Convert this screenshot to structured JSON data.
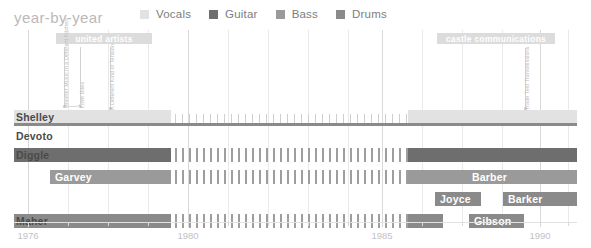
{
  "header": {
    "title": "year-by-year",
    "legend": [
      {
        "label": "Vocals",
        "color": "#e2e2e2"
      },
      {
        "label": "Guitar",
        "color": "#6e6e6e"
      },
      {
        "label": "Bass",
        "color": "#9a9a9a"
      },
      {
        "label": "Drums",
        "color": "#8a8a8a"
      }
    ]
  },
  "axis": {
    "ticks": [
      {
        "label": "1976",
        "x": 28
      },
      {
        "label": "1980",
        "x": 188
      },
      {
        "label": "1985",
        "x": 382
      },
      {
        "label": "1990",
        "x": 540
      }
    ],
    "minor_ticks": [
      68,
      108,
      148,
      228,
      268,
      308,
      348,
      422,
      462,
      502,
      568
    ],
    "range": [
      1976,
      1991
    ]
  },
  "record_labels": [
    {
      "name": "united artists",
      "x": 56,
      "width": 96,
      "y": 3
    },
    {
      "name": "castle communications",
      "x": 437,
      "width": 118,
      "y": 3
    }
  ],
  "releases": [
    {
      "title": "Another Music in a Different Kitchen",
      "x": 64,
      "stem_top": 17,
      "stem_bottom": 76
    },
    {
      "title": "Love Bites",
      "x": 80,
      "stem_top": 17,
      "stem_bottom": 76
    },
    {
      "title": "A Different Kind of Tension",
      "x": 110,
      "stem_top": 17,
      "stem_bottom": 78
    },
    {
      "title": "Trade Test Transmissions",
      "x": 525,
      "stem_top": 18,
      "stem_bottom": 78
    }
  ],
  "chart_data": {
    "type": "timeline",
    "title": "year-by-year",
    "xlabel": "",
    "ylabel": "",
    "xlim": [
      1976,
      1991
    ],
    "grid": true,
    "legend_position": "top",
    "roles": {
      "Vocals": "#e2e2e2",
      "Guitar": "#6e6e6e",
      "Bass": "#9a9a9a",
      "Drums": "#8a8a8a"
    },
    "rows": [
      {
        "member": "Shelley",
        "role": "Vocals",
        "name_x": 16,
        "name_color": "dark",
        "y": 80,
        "height": 13,
        "segments": [
          {
            "kind": "solid",
            "x": 14,
            "width": 157,
            "color": "#e2e2e2"
          },
          {
            "kind": "hatch",
            "x": 175,
            "width": 233,
            "color": "#cfcfcf",
            "tick_width": 1,
            "gap": 7,
            "tick_height": 9,
            "tick_top": 4
          },
          {
            "kind": "solid",
            "x": 408,
            "width": 169,
            "color": "#e2e2e2"
          }
        ],
        "underline": {
          "x": 14,
          "width": 563,
          "y": 13,
          "height": 3,
          "color": "#8a8a8a"
        }
      },
      {
        "member": "Devoto",
        "role": "Vocals",
        "name_x": 16,
        "name_color": "dark",
        "y": 99,
        "height": 13,
        "segments": []
      },
      {
        "member": "Diggle",
        "role": "Guitar",
        "name_x": 16,
        "name_color": "dark",
        "y": 118,
        "height": 14,
        "segments": [
          {
            "kind": "solid",
            "x": 14,
            "width": 157,
            "color": "#6e6e6e"
          },
          {
            "kind": "hatch",
            "x": 175,
            "width": 233,
            "color": "#9e9e9e",
            "tick_width": 2,
            "gap": 7,
            "tick_height": 14,
            "tick_top": 0
          },
          {
            "kind": "solid",
            "x": 408,
            "width": 169,
            "color": "#6e6e6e"
          }
        ]
      },
      {
        "member": "Garvey",
        "role": "Bass",
        "name_x": 55,
        "name_color": "light",
        "y": 140,
        "height": 14,
        "segments": [
          {
            "kind": "solid",
            "x": 50,
            "width": 121,
            "color": "#9a9a9a"
          },
          {
            "kind": "hatch",
            "x": 175,
            "width": 233,
            "color": "#9e9e9e",
            "tick_width": 2,
            "gap": 7,
            "tick_height": 14,
            "tick_top": 0
          },
          {
            "kind": "solid",
            "x": 408,
            "width": 60,
            "color": "#9a9a9a"
          }
        ]
      },
      {
        "member": "Barber",
        "role": "Bass",
        "name_x": 472,
        "name_color": "light",
        "y": 140,
        "height": 14,
        "segments": [
          {
            "kind": "solid",
            "x": 468,
            "width": 109,
            "color": "#9a9a9a"
          }
        ]
      },
      {
        "member": "Joyce",
        "role": "Drums",
        "name_x": 440,
        "name_color": "light",
        "y": 162,
        "height": 14,
        "segments": [
          {
            "kind": "solid",
            "x": 435,
            "width": 46,
            "color": "#8a8a8a"
          }
        ]
      },
      {
        "member": "Barker",
        "role": "Drums",
        "name_x": 508,
        "name_color": "light",
        "y": 162,
        "height": 14,
        "segments": [
          {
            "kind": "solid",
            "x": 503,
            "width": 74,
            "color": "#8a8a8a"
          }
        ]
      },
      {
        "member": "Maher",
        "role": "Drums",
        "name_x": 16,
        "name_color": "dark",
        "y": 184,
        "height": 14,
        "segments": [
          {
            "kind": "solid",
            "x": 14,
            "width": 157,
            "color": "#8a8a8a"
          },
          {
            "kind": "hatch",
            "x": 175,
            "width": 233,
            "color": "#9e9e9e",
            "tick_width": 2,
            "gap": 7,
            "tick_height": 14,
            "tick_top": 0
          },
          {
            "kind": "solid",
            "x": 408,
            "width": 35,
            "color": "#8a8a8a"
          }
        ]
      },
      {
        "member": "Gibson",
        "role": "Drums",
        "name_x": 474,
        "name_color": "light",
        "y": 184,
        "height": 14,
        "segments": [
          {
            "kind": "solid",
            "x": 469,
            "width": 55,
            "color": "#8a8a8a"
          }
        ]
      }
    ],
    "gridlines_major": [
      28,
      188,
      382,
      540
    ],
    "gridlines_minor": [
      68,
      108,
      148,
      228,
      268,
      308,
      348,
      422,
      462,
      502,
      568
    ]
  }
}
